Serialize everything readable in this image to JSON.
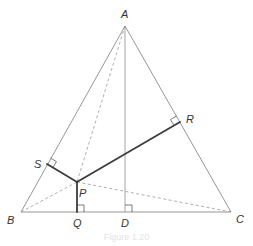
{
  "diagram": {
    "type": "geometry",
    "colors": {
      "triangle": "#8a8a8a",
      "altitude": "#9a9a9a",
      "dashed": "#9a9a9a",
      "perpendiculars": "#3c3c3c",
      "right_angle_marks": "#555555",
      "labels": "#333333"
    },
    "points": {
      "A": {
        "label": "A",
        "x": 125,
        "y": 26,
        "lx": 121,
        "ly": 18
      },
      "B": {
        "label": "B",
        "x": 21,
        "y": 212,
        "lx": 7,
        "ly": 224
      },
      "C": {
        "label": "C",
        "x": 231,
        "y": 212,
        "lx": 236,
        "ly": 223
      },
      "D": {
        "label": "D",
        "x": 125,
        "y": 212,
        "lx": 121,
        "ly": 227
      },
      "P": {
        "label": "P",
        "x": 77,
        "y": 182,
        "lx": 79,
        "ly": 197
      },
      "Q": {
        "label": "Q",
        "x": 77,
        "y": 212,
        "lx": 73,
        "ly": 227
      },
      "R": {
        "label": "R",
        "x": 180,
        "y": 122,
        "lx": 186,
        "ly": 123
      },
      "S": {
        "label": "S",
        "x": 47,
        "y": 164,
        "lx": 34,
        "ly": 168
      }
    },
    "segments": [
      {
        "from": "A",
        "to": "B",
        "style": "solid-thin"
      },
      {
        "from": "B",
        "to": "C",
        "style": "solid-thin"
      },
      {
        "from": "C",
        "to": "A",
        "style": "solid-thin"
      },
      {
        "from": "A",
        "to": "D",
        "style": "solid-thin",
        "role": "altitude"
      },
      {
        "from": "A",
        "to": "P",
        "style": "dashed"
      },
      {
        "from": "B",
        "to": "P",
        "style": "dashed"
      },
      {
        "from": "C",
        "to": "P",
        "style": "dashed"
      },
      {
        "from": "P",
        "to": "S",
        "style": "solid-thick"
      },
      {
        "from": "P",
        "to": "R",
        "style": "solid-thick"
      },
      {
        "from": "P",
        "to": "Q",
        "style": "solid-thick"
      }
    ],
    "right_angles": [
      "D",
      "Q",
      "R",
      "S"
    ],
    "labels": {
      "A": "A",
      "B": "B",
      "C": "C",
      "D": "D",
      "P": "P",
      "Q": "Q",
      "R": "R",
      "S": "S"
    },
    "caption": "Figure 1.20"
  }
}
